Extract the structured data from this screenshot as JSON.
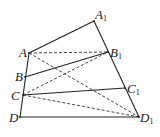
{
  "diagram": {
    "points": {
      "A": {
        "label": "A",
        "sub": "",
        "x": 29,
        "y": 53,
        "lx": 19,
        "ly": 57
      },
      "B": {
        "label": "B",
        "sub": "",
        "x": 25,
        "y": 77,
        "lx": 15,
        "ly": 81
      },
      "C": {
        "label": "C",
        "sub": "",
        "x": 23,
        "y": 95,
        "lx": 11,
        "ly": 100
      },
      "D": {
        "label": "D",
        "sub": "",
        "x": 20,
        "y": 117,
        "lx": 9,
        "ly": 122
      },
      "A1": {
        "label": "A",
        "sub": "1",
        "x": 94,
        "y": 21,
        "lx": 95,
        "ly": 19
      },
      "B1": {
        "label": "B",
        "sub": "1",
        "x": 108,
        "y": 52,
        "lx": 110,
        "ly": 57
      },
      "C1": {
        "label": "C",
        "sub": "1",
        "x": 125,
        "y": 88,
        "lx": 127,
        "ly": 93
      },
      "D1": {
        "label": "D",
        "sub": "1",
        "x": 139,
        "y": 117,
        "lx": 140,
        "ly": 122
      }
    },
    "solid_segments": [
      [
        "A",
        "A1"
      ],
      [
        "A1",
        "D1"
      ],
      [
        "A",
        "D"
      ],
      [
        "D",
        "D1"
      ],
      [
        "B",
        "B1"
      ],
      [
        "C",
        "C1"
      ]
    ],
    "dashed_segments": [
      [
        "A",
        "B1"
      ],
      [
        "A",
        "D1"
      ],
      [
        "C",
        "B1"
      ],
      [
        "C",
        "D1"
      ]
    ]
  }
}
